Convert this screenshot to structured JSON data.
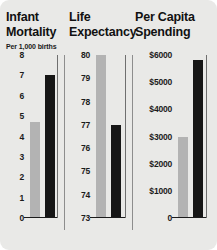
{
  "chart_data": {
    "type": "bar",
    "title": "",
    "layout": "three side-by-side panels, two bars each, independent y-axes",
    "legend_position": "none",
    "grid": false,
    "series": [
      {
        "name": "light-bar",
        "color": "#b3b3b3"
      },
      {
        "name": "dark-bar",
        "color": "#161616"
      }
    ],
    "panels": [
      {
        "header": "Infant\nMortality",
        "subtitle": "Per 1,000 births",
        "ylabel": "",
        "ylim": [
          0,
          8
        ],
        "ticks": [
          "8",
          "7",
          "6",
          "5",
          "4",
          "3",
          "2",
          "1",
          "0"
        ],
        "tick_values": [
          8,
          7,
          6,
          5,
          4,
          3,
          2,
          1,
          0
        ],
        "values": [
          4.7,
          7.0
        ]
      },
      {
        "header": "Life\nExpectancy",
        "subtitle": "",
        "ylabel": "",
        "ylim": [
          73,
          80
        ],
        "ticks": [
          "80",
          "79",
          "78",
          "77",
          "76",
          "75",
          "74",
          "73"
        ],
        "tick_values": [
          80,
          79,
          78,
          77,
          76,
          75,
          74,
          73
        ],
        "values": [
          80.0,
          77.0
        ]
      },
      {
        "header": "Per Capita\nSpending",
        "subtitle": "",
        "ylabel": "",
        "ylim": [
          0,
          6000
        ],
        "ticks": [
          "$6000",
          "$5000",
          "$4000",
          "$3000",
          "$2000",
          "$1000",
          "0"
        ],
        "tick_values": [
          6000,
          5000,
          4000,
          3000,
          2000,
          1000,
          0
        ],
        "values": [
          3000,
          5800
        ]
      }
    ]
  },
  "colors": {
    "background": "#e9e9e7",
    "light_bar": "#b3b3b3",
    "dark_bar": "#161616",
    "axis": "#1b1b1b",
    "divider": "#8d8d8d",
    "text": "#111111"
  }
}
